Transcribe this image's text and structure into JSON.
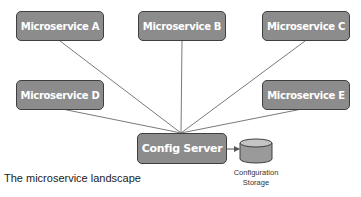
{
  "diagram": {
    "type": "architecture",
    "caption": "The microservice landscape",
    "colors": {
      "node_fill": "#8c8c8c",
      "node_border": "#3f3f3f",
      "node_text": "#ffffff",
      "edge": "#7a7a7a",
      "storage_fill": "#9a9a9a",
      "storage_top": "#c4c4c4"
    },
    "nodes": {
      "ms_a": {
        "label": "Microservice A"
      },
      "ms_b": {
        "label": "Microservice B"
      },
      "ms_c": {
        "label": "Microservice C"
      },
      "ms_d": {
        "label": "Microservice D"
      },
      "ms_e": {
        "label": "Microservice E"
      },
      "config_server": {
        "label": "Config Server"
      },
      "config_storage": {
        "label_line1": "Configuration",
        "label_line2": "Storage"
      }
    },
    "edges": [
      {
        "from": "Microservice A",
        "to": "Config Server"
      },
      {
        "from": "Microservice B",
        "to": "Config Server"
      },
      {
        "from": "Microservice C",
        "to": "Config Server"
      },
      {
        "from": "Microservice D",
        "to": "Config Server"
      },
      {
        "from": "Microservice E",
        "to": "Config Server"
      },
      {
        "from": "Config Server",
        "to": "Configuration Storage",
        "arrow": true
      }
    ]
  }
}
